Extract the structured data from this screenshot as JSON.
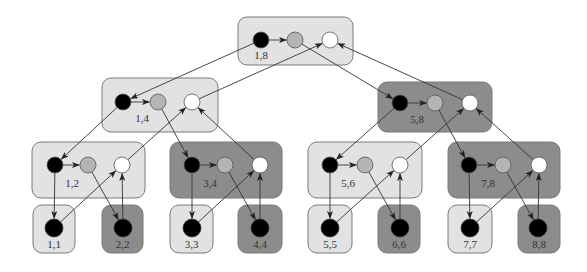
{
  "colors": {
    "light_box": "#e2e2e2",
    "dark_box": "#8c8c8c",
    "box_border": "#7a7a7a",
    "node_black": "#000000",
    "node_grey": "#b4b4b4",
    "node_white": "#ffffff",
    "edge": "#333333"
  },
  "internal_nodes": [
    {
      "id": "1,8",
      "label": "1,8",
      "shade": "light",
      "box": [
        238,
        17,
        353,
        65
      ],
      "y": 40,
      "nodes": [
        261,
        295,
        330
      ],
      "label_pos": [
        261,
        59
      ]
    },
    {
      "id": "1,4",
      "label": "1,4",
      "shade": "light",
      "box": [
        102,
        78,
        218,
        132
      ],
      "y": 102,
      "nodes": [
        123,
        158,
        192
      ],
      "label_pos": [
        142,
        122
      ]
    },
    {
      "id": "5,8",
      "label": "5,8",
      "shade": "dark",
      "box": [
        378,
        82,
        492,
        132
      ],
      "y": 103,
      "nodes": [
        400,
        435,
        470
      ],
      "label_pos": [
        417,
        123
      ]
    },
    {
      "id": "1,2",
      "label": "1,2",
      "shade": "light",
      "box": [
        32,
        142,
        145,
        198
      ],
      "y": 165,
      "nodes": [
        55,
        88,
        122
      ],
      "label_pos": [
        72,
        187
      ]
    },
    {
      "id": "3,4",
      "label": "3,4",
      "shade": "dark",
      "box": [
        170,
        142,
        282,
        198
      ],
      "y": 165,
      "nodes": [
        192,
        225,
        260
      ],
      "label_pos": [
        210,
        187
      ]
    },
    {
      "id": "5,6",
      "label": "5,6",
      "shade": "light",
      "box": [
        308,
        142,
        422,
        198
      ],
      "y": 165,
      "nodes": [
        330,
        365,
        400
      ],
      "label_pos": [
        348,
        187
      ]
    },
    {
      "id": "7,8",
      "label": "7,8",
      "shade": "dark",
      "box": [
        448,
        142,
        560,
        198
      ],
      "y": 165,
      "nodes": [
        469,
        503,
        539
      ],
      "label_pos": [
        488,
        187
      ]
    }
  ],
  "leaves": [
    {
      "id": "1,1",
      "label": "1,1",
      "shade": "light",
      "box": [
        33,
        205,
        75,
        253
      ],
      "node": [
        54,
        228
      ]
    },
    {
      "id": "2,2",
      "label": "2,2",
      "shade": "dark",
      "box": [
        102,
        205,
        143,
        253
      ],
      "node": [
        123,
        228
      ]
    },
    {
      "id": "3,3",
      "label": "3,3",
      "shade": "light",
      "box": [
        170,
        205,
        213,
        253
      ],
      "node": [
        192,
        228
      ]
    },
    {
      "id": "4,4",
      "label": "4,4",
      "shade": "dark",
      "box": [
        238,
        205,
        282,
        253
      ],
      "node": [
        260,
        228
      ]
    },
    {
      "id": "5,5",
      "label": "5,5",
      "shade": "light",
      "box": [
        308,
        205,
        352,
        253
      ],
      "node": [
        330,
        228
      ]
    },
    {
      "id": "6,6",
      "label": "6,6",
      "shade": "dark",
      "box": [
        378,
        205,
        420,
        253
      ],
      "node": [
        400,
        228
      ]
    },
    {
      "id": "7,7",
      "label": "7,7",
      "shade": "light",
      "box": [
        448,
        205,
        492,
        253
      ],
      "node": [
        470,
        228
      ]
    },
    {
      "id": "8,8",
      "label": "8,8",
      "shade": "dark",
      "box": [
        518,
        205,
        560,
        253
      ],
      "node": [
        538,
        228
      ]
    }
  ],
  "edges": [
    {
      "from": "1,8.black",
      "to": "1,8.grey"
    },
    {
      "from": "1,8.black",
      "to": "1,4.black"
    },
    {
      "from": "1,4.white",
      "to": "1,8.white"
    },
    {
      "from": "1,8.grey",
      "to": "5,8.black"
    },
    {
      "from": "5,8.white",
      "to": "1,8.white"
    },
    {
      "from": "1,4.black",
      "to": "1,4.grey"
    },
    {
      "from": "1,4.black",
      "to": "1,2.black"
    },
    {
      "from": "1,2.white",
      "to": "1,4.white"
    },
    {
      "from": "1,4.grey",
      "to": "3,4.black"
    },
    {
      "from": "3,4.white",
      "to": "1,4.white"
    },
    {
      "from": "5,8.black",
      "to": "5,8.grey"
    },
    {
      "from": "5,8.black",
      "to": "5,6.black"
    },
    {
      "from": "5,6.white",
      "to": "5,8.white"
    },
    {
      "from": "5,8.grey",
      "to": "7,8.black"
    },
    {
      "from": "7,8.white",
      "to": "5,8.white"
    },
    {
      "from": "1,2.black",
      "to": "1,2.grey"
    },
    {
      "from": "1,2.black",
      "to": "1,1"
    },
    {
      "from": "1,1",
      "to": "1,2.white"
    },
    {
      "from": "1,2.grey",
      "to": "2,2"
    },
    {
      "from": "2,2",
      "to": "1,2.white"
    },
    {
      "from": "3,4.black",
      "to": "3,4.grey"
    },
    {
      "from": "3,4.black",
      "to": "3,3"
    },
    {
      "from": "3,3",
      "to": "3,4.white"
    },
    {
      "from": "3,4.grey",
      "to": "4,4"
    },
    {
      "from": "4,4",
      "to": "3,4.white"
    },
    {
      "from": "5,6.black",
      "to": "5,6.grey"
    },
    {
      "from": "5,6.black",
      "to": "5,5"
    },
    {
      "from": "5,5",
      "to": "5,6.white"
    },
    {
      "from": "5,6.grey",
      "to": "6,6"
    },
    {
      "from": "6,6",
      "to": "5,6.white"
    },
    {
      "from": "7,8.black",
      "to": "7,8.grey"
    },
    {
      "from": "7,8.black",
      "to": "7,7"
    },
    {
      "from": "7,7",
      "to": "7,8.white"
    },
    {
      "from": "7,8.grey",
      "to": "8,8"
    },
    {
      "from": "8,8",
      "to": "7,8.white"
    }
  ]
}
